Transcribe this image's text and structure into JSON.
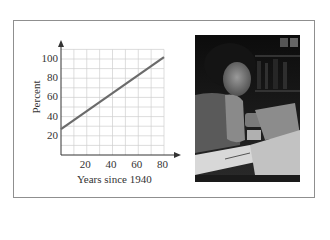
{
  "figure": {
    "photo_alt": "Woman studying at a desk with papers and books"
  },
  "chart_data": {
    "type": "line",
    "title": "",
    "xlabel": "Years since 1940",
    "ylabel": "Percent",
    "xlim": [
      0,
      80
    ],
    "ylim": [
      0,
      110
    ],
    "x_ticks": [
      20,
      40,
      60,
      80
    ],
    "y_ticks": [
      20,
      40,
      60,
      80,
      100
    ],
    "x_tick_labels": [
      "20",
      "40",
      "60",
      "80"
    ],
    "y_tick_labels": [
      "20",
      "40",
      "60",
      "80",
      "100"
    ],
    "grid": true,
    "grid_step_x": 10,
    "grid_step_y": 10,
    "series": [
      {
        "name": "Percent",
        "x": [
          0,
          80
        ],
        "y": [
          27,
          102
        ],
        "color": "#6b6b6b"
      }
    ],
    "legend": null
  }
}
